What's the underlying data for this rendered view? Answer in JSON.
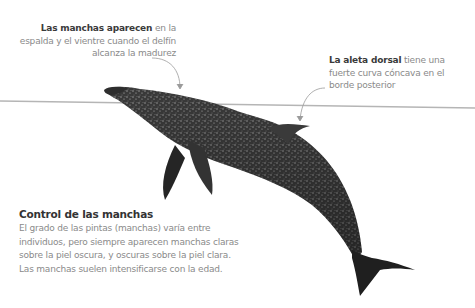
{
  "annotations": {
    "spots": {
      "bold": "Las manchas aparecen",
      "text": " en la espalda y el vientre cuando el delfín alcanza la madurez"
    },
    "dorsal_fin": {
      "bold": "La aleta dorsal",
      "text": " tiene una fuerte curva cóncava en el borde posterior"
    }
  },
  "panel": {
    "title": "Control de las manchas",
    "body": "El grado de las pintas (manchas) varía entre individuos, pero siempre aparecen manchas claras sobre la piel oscura, y oscuras sobre la piel clara. Las manchas suelen intensificarse con la edad."
  },
  "colors": {
    "waterline": "#b5b5b5",
    "leader": "#9a9a9a",
    "dolphin_dark": "#2a2a2a",
    "dolphin_mid": "#5a5a5a"
  }
}
